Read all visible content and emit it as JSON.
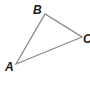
{
  "diagram": {
    "type": "triangle",
    "stroke_color": "#8a8a8a",
    "label_color": "#1a1a1a",
    "vertices": [
      {
        "name": "A",
        "x": 16,
        "y": 64,
        "label_x": 5,
        "label_y": 71
      },
      {
        "name": "B",
        "x": 45,
        "y": 14,
        "label_x": 33,
        "label_y": 14
      },
      {
        "name": "C",
        "x": 82,
        "y": 37,
        "label_x": 83,
        "label_y": 43
      }
    ]
  }
}
